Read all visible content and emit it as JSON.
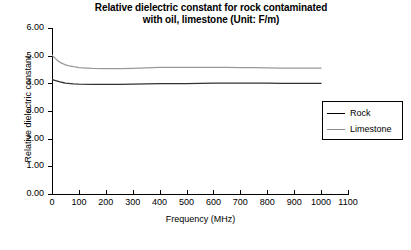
{
  "chart_data": {
    "type": "line",
    "title": "Relative dielectric constant for rock contaminated with oil, limestone (Unit: F/m)",
    "title_line1": "Relative dielectric constant for rock contaminated",
    "title_line2": "with oil, limestone (Unit: F/m)",
    "xlabel": "Frequency (MHz)",
    "ylabel": "Relative dielectric constant",
    "xlim": [
      0,
      1100
    ],
    "ylim": [
      0,
      6
    ],
    "xticks": [
      0,
      100,
      200,
      300,
      400,
      500,
      600,
      700,
      800,
      900,
      1000,
      1100
    ],
    "xticklabels": [
      "0",
      "100",
      "200",
      "300",
      "400",
      "500",
      "600",
      "700",
      "800",
      "900",
      "1000",
      "1100"
    ],
    "yticks": [
      0,
      1,
      2,
      3,
      4,
      5,
      6
    ],
    "yticklabels": [
      "0.00",
      "1.00",
      "2.00",
      "3.00",
      "4.00",
      "5.00",
      "6.00"
    ],
    "grid": false,
    "legend_position": "right-middle",
    "series": [
      {
        "name": "Rock",
        "color": "#333333",
        "x": [
          0,
          10,
          20,
          30,
          40,
          50,
          60,
          80,
          100,
          150,
          200,
          250,
          300,
          350,
          400,
          450,
          500,
          550,
          600,
          650,
          700,
          750,
          800,
          850,
          900,
          950,
          1000
        ],
        "values": [
          4.14,
          4.11,
          4.08,
          4.05,
          4.03,
          4.01,
          4.0,
          3.98,
          3.97,
          3.96,
          3.96,
          3.96,
          3.97,
          3.98,
          3.99,
          3.99,
          3.99,
          4.0,
          4.01,
          4.01,
          4.01,
          4.01,
          4.01,
          4.0,
          4.0,
          4.0,
          4.0
        ]
      },
      {
        "name": "Limestone",
        "color": "#999999",
        "x": [
          0,
          10,
          20,
          30,
          40,
          50,
          60,
          80,
          100,
          150,
          200,
          250,
          300,
          350,
          400,
          450,
          500,
          550,
          600,
          650,
          700,
          750,
          800,
          850,
          900,
          950,
          1000
        ],
        "values": [
          5.02,
          4.92,
          4.83,
          4.76,
          4.71,
          4.67,
          4.64,
          4.6,
          4.57,
          4.54,
          4.53,
          4.53,
          4.54,
          4.56,
          4.58,
          4.58,
          4.58,
          4.58,
          4.58,
          4.58,
          4.57,
          4.57,
          4.56,
          4.55,
          4.55,
          4.55,
          4.55
        ]
      }
    ]
  },
  "legend": {
    "items": [
      {
        "label": "Rock"
      },
      {
        "label": "Limestone"
      }
    ]
  }
}
